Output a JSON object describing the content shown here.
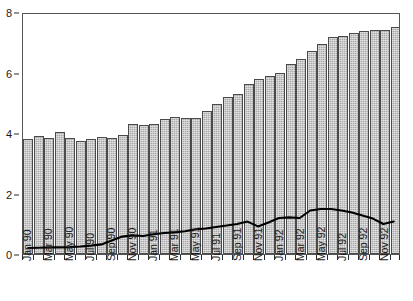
{
  "chart_data": {
    "type": "bar",
    "title": "",
    "xlabel": "",
    "ylabel": "",
    "ylim": [
      0,
      8
    ],
    "yticks": [
      0,
      2,
      4,
      6,
      8
    ],
    "ytick_labels": [
      "0",
      "2",
      "4",
      "6",
      "8"
    ],
    "grid": false,
    "legend": "none",
    "categories": [
      "Jan 90",
      "Feb 90",
      "Mar 90",
      "Apr 90",
      "May 90",
      "Jun 90",
      "Jul 90",
      "Aug 90",
      "Sep 90",
      "Oct 90",
      "Nov 90",
      "Dec 90",
      "Jan 91",
      "Feb 91",
      "Mar 91",
      "Apr 91",
      "May 91",
      "Jun 91",
      "Jul 91",
      "Aug 91",
      "Sep 91",
      "Oct 91",
      "Nov 91",
      "Dec 91",
      "Jan 92",
      "Feb 92",
      "Mar 92",
      "Apr 92",
      "May 92",
      "Jun 92",
      "Jul 92",
      "Aug 92",
      "Sep 92",
      "Oct 92",
      "Nov 92",
      "Dec 92"
    ],
    "visible_tick_labels": [
      "Jan 90",
      "Mar 90",
      "May 90",
      "Jul 90",
      "Sep 90",
      "Nov 90",
      "Jan 91",
      "Mar 91",
      "May 91",
      "Jul 91",
      "Sep 91",
      "Nov 91",
      "Jan 92",
      "Mar 92",
      "May 92",
      "Jul 92",
      "Sep 92",
      "Nov 92"
    ],
    "visible_tick_indices": [
      0,
      2,
      4,
      6,
      8,
      10,
      12,
      14,
      16,
      18,
      20,
      22,
      24,
      26,
      28,
      30,
      32,
      34
    ],
    "series": [
      {
        "name": "bars",
        "render": "bar",
        "color": "#a9a9a9",
        "edge_color": "#4a4a4a",
        "values": [
          3.8,
          3.9,
          3.82,
          4.05,
          3.85,
          3.72,
          3.8,
          3.88,
          3.85,
          3.95,
          4.3,
          4.28,
          4.3,
          4.45,
          4.52,
          4.48,
          4.5,
          4.72,
          4.95,
          5.2,
          5.28,
          5.62,
          5.78,
          5.9,
          6.0,
          6.28,
          6.45,
          6.7,
          6.95,
          7.18,
          7.22,
          7.3,
          7.38,
          7.4,
          7.42,
          7.52
        ]
      },
      {
        "name": "line",
        "render": "line",
        "color": "#000000",
        "values": [
          0.2,
          0.21,
          0.22,
          0.22,
          0.23,
          0.25,
          0.28,
          0.32,
          0.45,
          0.58,
          0.62,
          0.6,
          0.66,
          0.7,
          0.72,
          0.76,
          0.82,
          0.85,
          0.9,
          0.95,
          1.0,
          1.08,
          0.92,
          1.05,
          1.2,
          1.22,
          1.2,
          1.45,
          1.5,
          1.5,
          1.45,
          1.38,
          1.28,
          1.18,
          1.0,
          1.08
        ]
      }
    ]
  }
}
